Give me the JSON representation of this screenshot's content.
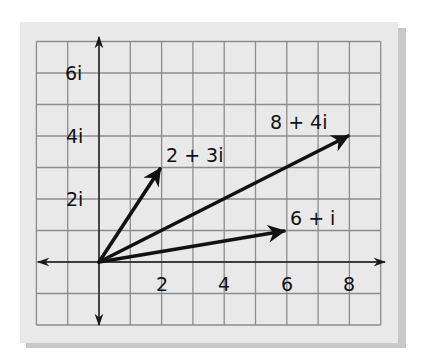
{
  "diagram": {
    "type": "complex-plane-vectors",
    "origin": [
      0,
      0
    ],
    "x_range": [
      -2,
      9
    ],
    "y_range": [
      -2,
      7
    ],
    "x_tick_labels": [
      {
        "value": 2,
        "text": "2"
      },
      {
        "value": 4,
        "text": "4"
      },
      {
        "value": 6,
        "text": "6"
      },
      {
        "value": 8,
        "text": "8"
      }
    ],
    "y_tick_labels": [
      {
        "value": 2,
        "text": "2i"
      },
      {
        "value": 4,
        "text": "4i"
      },
      {
        "value": 6,
        "text": "6i"
      }
    ],
    "vectors": [
      {
        "name": "2+3i",
        "re": 2,
        "im": 3,
        "label": "2 + 3i"
      },
      {
        "name": "8+4i",
        "re": 8,
        "im": 4,
        "label": "8 + 4i"
      },
      {
        "name": "6+i",
        "re": 6,
        "im": 1,
        "label": "6 + i"
      }
    ],
    "colors": {
      "paper": "#e9e9e9",
      "grid": "#8c8c8c",
      "axis": "#1a1a1a",
      "vector": "#111111",
      "shadow": "#9a9a9a"
    }
  }
}
